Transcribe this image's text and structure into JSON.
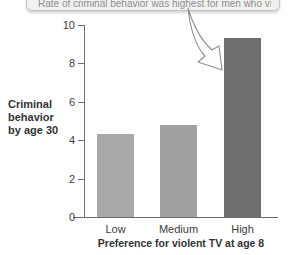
{
  "figure": {
    "callout": {
      "clipped_text": "Rate of criminal behavior was highest for men who viewed violent TV at age 8"
    },
    "arrow_icon": "curved-arrow"
  },
  "chart_data": {
    "type": "bar",
    "categories": [
      "Low",
      "Medium",
      "High"
    ],
    "values": [
      4.3,
      4.8,
      9.3
    ],
    "title": "",
    "xlabel": "Preference for violent TV at age 8",
    "ylabel": "Criminal behavior by age 30",
    "ylim": [
      0,
      10
    ],
    "yticks": [
      0,
      2,
      4,
      6,
      8,
      10
    ],
    "grid": false,
    "legend": "none",
    "bar_colors": [
      "#a9a9a9",
      "#a0a0a0",
      "#6e6e6e"
    ],
    "axis_color": "#6c6c6c",
    "text_color": "#3c3c3c"
  }
}
